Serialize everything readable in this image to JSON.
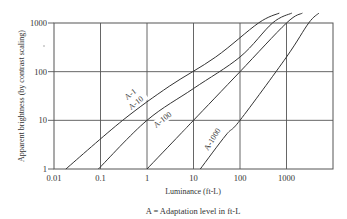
{
  "chart_data": {
    "type": "line",
    "title": "",
    "xlabel": "Luminance (ft-L)",
    "ylabel": "Apparent brightness (by contrast scaling)",
    "caption": "A = Adaptation level in ft-L",
    "x_scale": "log",
    "y_scale": "log",
    "xlim": [
      0.01,
      10000
    ],
    "ylim": [
      1,
      1000
    ],
    "x_ticks": [
      "0.01",
      "0.1",
      "1",
      "10",
      "100",
      "1000"
    ],
    "y_ticks": [
      "1",
      "10",
      "100",
      "1000"
    ],
    "grid": true,
    "legend": "inline curve labels",
    "series": [
      {
        "name": "A-1",
        "points": [
          [
            0.018,
            1
          ],
          [
            0.3,
            10
          ],
          [
            3,
            50
          ],
          [
            30,
            200
          ],
          [
            250,
            1000
          ],
          [
            700,
            1600
          ]
        ]
      },
      {
        "name": "A-10",
        "points": [
          [
            0.09,
            1
          ],
          [
            1,
            10
          ],
          [
            10,
            45
          ],
          [
            100,
            200
          ],
          [
            500,
            1000
          ],
          [
            1300,
            1600
          ]
        ]
      },
      {
        "name": "A-100",
        "points": [
          [
            1,
            1
          ],
          [
            5,
            5
          ],
          [
            10,
            10
          ],
          [
            100,
            100
          ],
          [
            1000,
            1000
          ],
          [
            2200,
            1600
          ]
        ]
      },
      {
        "name": "A-1000",
        "points": [
          [
            14,
            1
          ],
          [
            50,
            5
          ],
          [
            100,
            10
          ],
          [
            1000,
            200
          ],
          [
            3000,
            1000
          ],
          [
            5000,
            1600
          ]
        ]
      }
    ]
  }
}
